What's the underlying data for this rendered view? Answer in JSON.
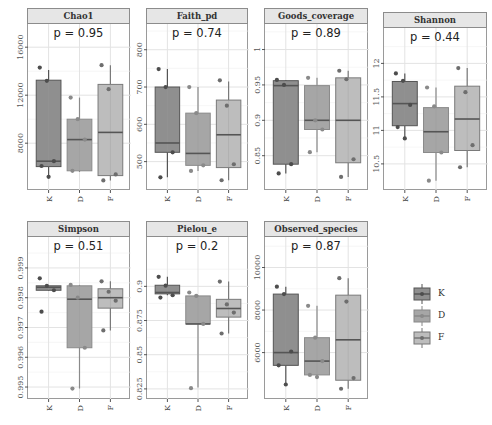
{
  "colors": {
    "K": "#8f8f8f",
    "D": "#a6a6a6",
    "F": "#bdbdbd",
    "K_point": "#4d4d4d",
    "D_point": "#8a8a8a",
    "F_point": "#6e6e6e",
    "median": "#555555",
    "grid": "#e3e3e3"
  },
  "legend": {
    "items": [
      {
        "label": "K"
      },
      {
        "label": "D"
      },
      {
        "label": "F"
      }
    ]
  },
  "chart_data": [
    {
      "type": "box",
      "title": "Chao1",
      "p_label": "p = 0.95",
      "categories": [
        "K",
        "D",
        "F"
      ],
      "yticks": [
        8000,
        12000,
        16000
      ],
      "ylim": [
        4600,
        16100
      ],
      "series": [
        {
          "name": "K",
          "q1": 6050,
          "median": 6500,
          "q3": 13250,
          "whisker_low": 5200,
          "whisker_high": 14100,
          "points": [
            14300,
            13200,
            6500,
            6100,
            5200
          ]
        },
        {
          "name": "D",
          "q1": 5700,
          "median": 8300,
          "q3": 10000,
          "whisker_low": 5600,
          "whisker_high": 11800,
          "points": [
            11800,
            10000,
            8300,
            5700
          ]
        },
        {
          "name": "F",
          "q1": 5300,
          "median": 8900,
          "q3": 12900,
          "whisker_low": 4900,
          "whisker_high": 14500,
          "points": [
            14500,
            12500,
            5400,
            4900
          ]
        }
      ]
    },
    {
      "type": "box",
      "title": "Faith_pd",
      "p_label": "p = 0.74",
      "categories": [
        "K",
        "D",
        "F"
      ],
      "yticks": [
        500,
        600,
        700,
        800
      ],
      "ylim": [
        440,
        810
      ],
      "series": [
        {
          "name": "K",
          "q1": 525,
          "median": 550,
          "q3": 700,
          "whisker_low": 458,
          "whisker_high": 748,
          "points": [
            748,
            700,
            525,
            458
          ]
        },
        {
          "name": "D",
          "q1": 490,
          "median": 522,
          "q3": 630,
          "whisker_low": 475,
          "whisker_high": 700,
          "points": [
            700,
            630,
            490,
            475
          ]
        },
        {
          "name": "F",
          "q1": 484,
          "median": 572,
          "q3": 665,
          "whisker_low": 450,
          "whisker_high": 715,
          "points": [
            718,
            650,
            493,
            450
          ]
        }
      ]
    },
    {
      "type": "box",
      "title": "Goods_coverage",
      "p_label": "p = 0.89",
      "categories": [
        "K",
        "D",
        "F"
      ],
      "yticks": [
        0.85,
        0.9,
        0.95,
        1.0
      ],
      "ylim": [
        0.81,
        1.005
      ],
      "series": [
        {
          "name": "K",
          "q1": 0.838,
          "median": 0.949,
          "q3": 0.956,
          "whisker_low": 0.825,
          "whisker_high": 0.957,
          "points": [
            0.957,
            0.95,
            0.838,
            0.825
          ]
        },
        {
          "name": "D",
          "q1": 0.887,
          "median": 0.9,
          "q3": 0.949,
          "whisker_low": 0.855,
          "whisker_high": 0.96,
          "points": [
            0.96,
            0.9,
            0.887,
            0.855
          ]
        },
        {
          "name": "F",
          "q1": 0.84,
          "median": 0.9,
          "q3": 0.96,
          "whisker_low": 0.82,
          "whisker_high": 0.97,
          "points": [
            0.97,
            0.958,
            0.845,
            0.82
          ]
        }
      ]
    },
    {
      "type": "box",
      "title": "Shannon",
      "p_label": "p = 0.44",
      "categories": [
        "K",
        "D",
        "F"
      ],
      "yticks": [
        10.5,
        11.0,
        11.5,
        12.0
      ],
      "ylim": [
        10.2,
        12.2
      ],
      "series": [
        {
          "name": "K",
          "q1": 11.07,
          "median": 11.4,
          "q3": 11.73,
          "whisker_low": 10.88,
          "whisker_high": 11.85,
          "points": [
            11.85,
            11.74,
            11.38,
            11.05,
            10.88
          ]
        },
        {
          "name": "D",
          "q1": 10.67,
          "median": 10.98,
          "q3": 11.34,
          "whisker_low": 10.25,
          "whisker_high": 11.64,
          "points": [
            11.64,
            11.36,
            10.67,
            10.25
          ]
        },
        {
          "name": "F",
          "q1": 10.7,
          "median": 11.17,
          "q3": 11.66,
          "whisker_low": 10.45,
          "whisker_high": 11.93,
          "points": [
            11.93,
            11.57,
            10.78,
            10.45
          ]
        }
      ]
    },
    {
      "type": "box",
      "title": "Simpson",
      "p_label": "p = 0.51",
      "categories": [
        "K",
        "D",
        "F"
      ],
      "yticks": [
        0.995,
        0.996,
        0.997,
        0.998,
        0.999
      ],
      "ylim": [
        0.9948,
        0.9993
      ],
      "series": [
        {
          "name": "K",
          "q1": 0.99825,
          "median": 0.99835,
          "q3": 0.9984,
          "whisker_low": 0.99823,
          "whisker_high": 0.9984,
          "points": [
            0.99865,
            0.9984,
            0.99825,
            0.99753
          ]
        },
        {
          "name": "D",
          "q1": 0.99632,
          "median": 0.99795,
          "q3": 0.9984,
          "whisker_low": 0.99495,
          "whisker_high": 0.99843,
          "points": [
            0.99843,
            0.998,
            0.99632,
            0.99495
          ]
        },
        {
          "name": "F",
          "q1": 0.99765,
          "median": 0.998,
          "q3": 0.9983,
          "whisker_low": 0.9969,
          "whisker_high": 0.99855,
          "points": [
            0.99855,
            0.9982,
            0.9979,
            0.9969
          ]
        }
      ]
    },
    {
      "type": "box",
      "title": "Pielou_e",
      "p_label": "p = 0.2",
      "categories": [
        "K",
        "D",
        "F"
      ],
      "yticks": [
        0.825,
        0.85,
        0.875,
        0.9
      ],
      "ylim": [
        0.822,
        0.92
      ],
      "series": [
        {
          "name": "K",
          "q1": 0.8945,
          "median": 0.8955,
          "q3": 0.9008,
          "whisker_low": 0.8935,
          "whisker_high": 0.907,
          "points": [
            0.907,
            0.9005,
            0.8935,
            0.8918
          ]
        },
        {
          "name": "D",
          "q1": 0.8725,
          "median": 0.8725,
          "q3": 0.893,
          "whisker_low": 0.826,
          "whisker_high": 0.8935,
          "points": [
            0.8955,
            0.893,
            0.8725,
            0.8255
          ]
        },
        {
          "name": "F",
          "q1": 0.8775,
          "median": 0.8838,
          "q3": 0.8905,
          "whisker_low": 0.8655,
          "whisker_high": 0.9035,
          "points": [
            0.9035,
            0.8868,
            0.8808,
            0.8655
          ]
        }
      ]
    },
    {
      "type": "box",
      "title": "Observed_species",
      "p_label": "p = 0.87",
      "categories": [
        "K",
        "D",
        "F"
      ],
      "yticks": [
        6000,
        8000,
        10000
      ],
      "ylim": [
        4100,
        10400
      ],
      "series": [
        {
          "name": "K",
          "q1": 5400,
          "median": 6000,
          "q3": 8750,
          "whisker_low": 4500,
          "whisker_high": 9100,
          "points": [
            9100,
            8750,
            6050,
            5400,
            4500
          ]
        },
        {
          "name": "D",
          "q1": 4950,
          "median": 5600,
          "q3": 6700,
          "whisker_low": 4850,
          "whisker_high": 8200,
          "points": [
            8200,
            6700,
            5600,
            4950,
            4850
          ]
        },
        {
          "name": "F",
          "q1": 4700,
          "median": 6600,
          "q3": 8700,
          "whisker_low": 4300,
          "whisker_high": 9500,
          "points": [
            9500,
            8400,
            4800,
            4300
          ]
        }
      ]
    }
  ]
}
